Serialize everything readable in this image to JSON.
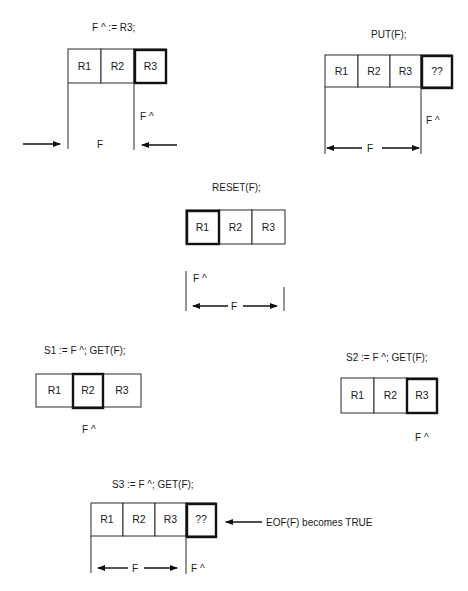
{
  "panels": {
    "assign": {
      "caption": "F ^ := R3;",
      "cells": [
        "R1",
        "R2",
        "R3"
      ],
      "current_index": 2,
      "pointer_label": "F ^",
      "window_label": "F"
    },
    "put": {
      "caption": "PUT(F);",
      "cells": [
        "R1",
        "R2",
        "R3",
        "??"
      ],
      "current_index": 3,
      "pointer_label": "F ^",
      "window_label": "F"
    },
    "reset": {
      "caption": "RESET(F);",
      "cells": [
        "R1",
        "R2",
        "R3"
      ],
      "current_index": 0,
      "pointer_label": "F ^",
      "window_label": "F"
    },
    "get1": {
      "caption": "S1 := F ^; GET(F);",
      "cells": [
        "R1",
        "R2",
        "R3"
      ],
      "current_index": 1,
      "pointer_label": "F ^"
    },
    "get2": {
      "caption": "S2 := F ^; GET(F);",
      "cells": [
        "R1",
        "R2",
        "R3"
      ],
      "current_index": 2,
      "pointer_label": "F ^"
    },
    "get3": {
      "caption": "S3 := F ^; GET(F);",
      "cells": [
        "R1",
        "R2",
        "R3",
        "??"
      ],
      "current_index": 3,
      "pointer_label": "F ^",
      "window_label": "F",
      "eof_note": "EOF(F) becomes TRUE"
    }
  },
  "colors": {
    "ink": "#1a1a1a",
    "background": "#ffffff"
  }
}
